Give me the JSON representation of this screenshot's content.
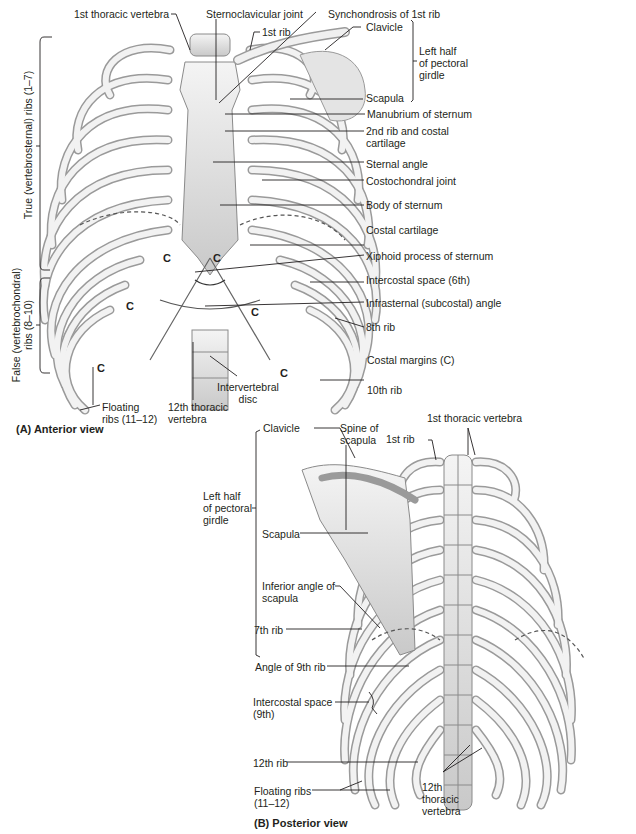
{
  "anterior": {
    "title": "(A) Anterior view",
    "labels": {
      "first_thoracic_vertebra": "1st thoracic vertebra",
      "sternoclavicular_joint": "Sternoclavicular joint",
      "synchondrosis_first_rib": "Synchondrosis of 1st rib",
      "first_rib": "1st rib",
      "clavicle": "Clavicle",
      "left_half_pectoral_girdle": "Left half\nof pectoral\ngirdle",
      "scapula": "Scapula",
      "manubrium": "Manubrium of sternum",
      "second_rib_costal_cartilage": "2nd rib and costal\ncartilage",
      "sternal_angle": "Sternal angle",
      "costochondral_joint": "Costochondral joint",
      "body_of_sternum": "Body of sternum",
      "costal_cartilage": "Costal cartilage",
      "xiphoid_process": "Xiphoid process of sternum",
      "intercostal_space_6th": "Intercostal space (6th)",
      "infrasternal_angle": "Infrasternal (subcostal) angle",
      "eighth_rib": "8th rib",
      "costal_margins": "Costal margins (C)",
      "tenth_rib": "10th rib",
      "intervertebral_disc": "Intervertebral\ndisc",
      "twelfth_thoracic_vertebra": "12th thoracic\nvertebra",
      "floating_ribs": "Floating\nribs (11–12)",
      "true_ribs": "True (vertebrosternal) ribs (1–7)",
      "false_ribs": "False (vertebrochondral)\nribs (8–10)"
    },
    "costal_margin_marker": "C"
  },
  "posterior": {
    "title": "(B) Posterior view",
    "labels": {
      "clavicle": "Clavicle",
      "spine_of_scapula": "Spine of\nscapula",
      "first_rib": "1st rib",
      "first_thoracic_vertebra": "1st thoracic vertebra",
      "left_half_pectoral_girdle": "Left half\nof pectoral\ngirdle",
      "scapula": "Scapula",
      "inferior_angle_scapula": "Inferior angle of\nscapula",
      "seventh_rib": "7th rib",
      "angle_ninth_rib": "Angle of 9th rib",
      "intercostal_space_9th": "Intercostal space\n(9th)",
      "twelfth_rib": "12th rib",
      "floating_ribs": "Floating ribs\n(11–12)",
      "twelfth_thoracic_vertebra": "12th\nthoracic\nvertebra"
    }
  },
  "colors": {
    "bone": "#e9e9e9",
    "bone_shade": "#bdbdbd",
    "outline": "#8a8a8a",
    "leader": "#231f20",
    "text": "#231f20"
  }
}
